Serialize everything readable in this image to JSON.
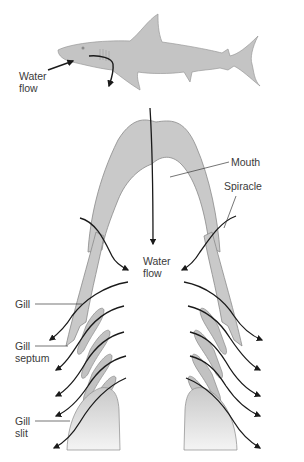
{
  "diagram": {
    "labels": {
      "water_flow_top_line1": "Water",
      "water_flow_top_line2": "flow",
      "mouth": "Mouth",
      "spiracle": "Spiracle",
      "water_flow_center_line1": "Water",
      "water_flow_center_line2": "flow",
      "gill": "Gill",
      "gill_septum_line1": "Gill",
      "gill_septum_line2": "septum",
      "gill_slit_line1": "Gill",
      "gill_slit_line2": "slit"
    },
    "colors": {
      "tissue_fill": "#c9c9c9",
      "tissue_stroke": "#8a8a8a",
      "arrow": "#1a1a1a",
      "label_text": "#3a3a3a",
      "shark_fill": "#c4c4c4"
    }
  }
}
